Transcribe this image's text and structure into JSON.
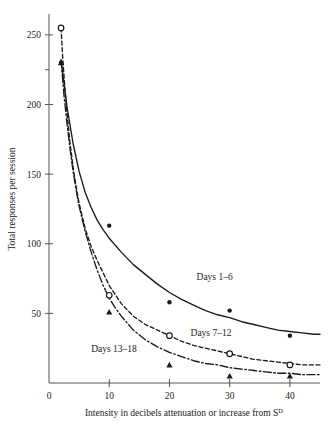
{
  "chart_data": {
    "type": "line",
    "title": "",
    "xlabel": "Intensity in decibels attenuation or increase from S",
    "xlabel_superscript": "D",
    "ylabel": "Total responses per session",
    "xlim": [
      0,
      45
    ],
    "ylim": [
      0,
      265
    ],
    "xticks": [
      0,
      10,
      20,
      30,
      40
    ],
    "xtick_labels": [
      "0",
      "10",
      "20",
      "30",
      "40"
    ],
    "yticks": [
      50,
      100,
      150,
      200,
      250
    ],
    "ytick_labels": [
      "50",
      "100",
      "150",
      "200",
      "250"
    ],
    "yticks_minor": [
      225
    ],
    "grid": false,
    "legend_position": "inline-annotations",
    "series": [
      {
        "name": "Days 1-6",
        "label": "Days 1–6",
        "marker": "filled-circle",
        "line_style": "solid",
        "label_x": 24.5,
        "label_y": 74,
        "x": [
          2,
          10,
          20,
          30,
          40
        ],
        "values": [
          230,
          113,
          58,
          52,
          34
        ],
        "curve": [
          [
            2,
            232
          ],
          [
            3,
            198
          ],
          [
            4,
            172
          ],
          [
            5,
            152
          ],
          [
            6,
            137
          ],
          [
            7,
            126
          ],
          [
            8,
            117
          ],
          [
            9,
            110
          ],
          [
            10,
            104
          ],
          [
            12,
            94
          ],
          [
            14,
            85
          ],
          [
            16,
            78
          ],
          [
            18,
            71
          ],
          [
            20,
            65
          ],
          [
            22,
            60
          ],
          [
            24,
            56
          ],
          [
            26,
            52
          ],
          [
            28,
            49
          ],
          [
            30,
            47
          ],
          [
            32,
            44
          ],
          [
            34,
            42
          ],
          [
            36,
            40
          ],
          [
            38,
            38
          ],
          [
            40,
            37
          ],
          [
            42,
            36
          ],
          [
            44,
            35
          ],
          [
            45,
            35
          ]
        ]
      },
      {
        "name": "Days 7-12",
        "label": "Days 7–12",
        "marker": "open-circle",
        "line_style": "dashed",
        "label_x": 23.5,
        "label_y": 34,
        "x": [
          2,
          10,
          20,
          30,
          40
        ],
        "values": [
          255,
          63,
          34,
          21,
          13
        ],
        "curve": [
          [
            2,
            255
          ],
          [
            2.3,
            232
          ],
          [
            2.6,
            214
          ],
          [
            3,
            193
          ],
          [
            3.5,
            172
          ],
          [
            4,
            155
          ],
          [
            4.5,
            141
          ],
          [
            5,
            129
          ],
          [
            6,
            111
          ],
          [
            7,
            98
          ],
          [
            8,
            88
          ],
          [
            9,
            79
          ],
          [
            10,
            70
          ],
          [
            12,
            57
          ],
          [
            14,
            48
          ],
          [
            16,
            42
          ],
          [
            18,
            38
          ],
          [
            20,
            34
          ],
          [
            22,
            30
          ],
          [
            24,
            27
          ],
          [
            26,
            25
          ],
          [
            28,
            23
          ],
          [
            30,
            21
          ],
          [
            32,
            19
          ],
          [
            34,
            17
          ],
          [
            36,
            16
          ],
          [
            38,
            15
          ],
          [
            40,
            14
          ],
          [
            42,
            13
          ],
          [
            44,
            13
          ],
          [
            45,
            13
          ]
        ]
      },
      {
        "name": "Days 13-18",
        "label": "Days 13–18",
        "marker": "filled-triangle",
        "line_style": "dash-dot",
        "label_x": 7.0,
        "label_y": 22,
        "x": [
          2,
          10,
          20,
          30,
          40
        ],
        "values": [
          230,
          51,
          13,
          5,
          5
        ],
        "curve": [
          [
            2,
            232
          ],
          [
            2.5,
            206
          ],
          [
            3,
            186
          ],
          [
            3.5,
            168
          ],
          [
            4,
            152
          ],
          [
            4.5,
            139
          ],
          [
            5,
            127
          ],
          [
            6,
            109
          ],
          [
            7,
            94
          ],
          [
            8,
            81
          ],
          [
            9,
            70
          ],
          [
            10,
            61
          ],
          [
            11,
            54
          ],
          [
            12,
            48
          ],
          [
            14,
            38
          ],
          [
            16,
            31
          ],
          [
            18,
            26
          ],
          [
            20,
            22
          ],
          [
            22,
            19
          ],
          [
            24,
            16
          ],
          [
            26,
            14
          ],
          [
            28,
            13
          ],
          [
            30,
            11
          ],
          [
            32,
            10
          ],
          [
            34,
            9
          ],
          [
            36,
            8
          ],
          [
            38,
            7
          ],
          [
            40,
            7
          ],
          [
            42,
            6
          ],
          [
            44,
            6
          ],
          [
            45,
            6
          ]
        ]
      }
    ]
  },
  "colors": {
    "axis": "#555555",
    "ink": "#1a1a1a",
    "background": "#ffffff"
  }
}
